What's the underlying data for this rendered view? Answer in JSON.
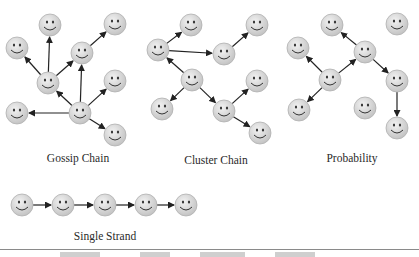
{
  "diagrams": [
    {
      "id": "gossip",
      "label": "Gossip Chain",
      "label_pos": [
        78,
        152
      ],
      "nodes": [
        [
          50,
          25
        ],
        [
          115,
          24
        ],
        [
          17,
          48
        ],
        [
          82,
          53
        ],
        [
          48,
          83
        ],
        [
          115,
          81
        ],
        [
          17,
          113
        ],
        [
          80,
          113
        ],
        [
          115,
          135
        ]
      ],
      "edges": [
        [
          7,
          4
        ],
        [
          7,
          3
        ],
        [
          7,
          6
        ],
        [
          7,
          5
        ],
        [
          7,
          8
        ],
        [
          4,
          2
        ],
        [
          4,
          0
        ],
        [
          4,
          3
        ],
        [
          3,
          1
        ]
      ]
    },
    {
      "id": "cluster",
      "label": "Cluster Chain",
      "label_pos": [
        216,
        154
      ],
      "nodes": [
        [
          158,
          50
        ],
        [
          191,
          25
        ],
        [
          224,
          54
        ],
        [
          257,
          25
        ],
        [
          192,
          80
        ],
        [
          162,
          109
        ],
        [
          224,
          111
        ],
        [
          257,
          81
        ],
        [
          260,
          133
        ]
      ],
      "edges": [
        [
          0,
          1
        ],
        [
          0,
          2
        ],
        [
          2,
          3
        ],
        [
          4,
          0
        ],
        [
          4,
          5
        ],
        [
          4,
          6
        ],
        [
          6,
          7
        ],
        [
          6,
          8
        ]
      ]
    },
    {
      "id": "probability",
      "label": "Probability",
      "label_pos": [
        352,
        152
      ],
      "nodes": [
        [
          332,
          25
        ],
        [
          397,
          24
        ],
        [
          298,
          48
        ],
        [
          365,
          52
        ],
        [
          330,
          80
        ],
        [
          397,
          81
        ],
        [
          299,
          110
        ],
        [
          365,
          108
        ],
        [
          397,
          128
        ]
      ],
      "edges": [
        [
          4,
          2
        ],
        [
          4,
          3
        ],
        [
          4,
          6
        ],
        [
          3,
          0
        ],
        [
          3,
          5
        ],
        [
          5,
          8
        ]
      ]
    },
    {
      "id": "single",
      "label": "Single Strand",
      "label_pos": [
        105,
        230
      ],
      "nodes": [
        [
          22,
          205
        ],
        [
          63,
          205
        ],
        [
          105,
          205
        ],
        [
          146,
          205
        ],
        [
          186,
          205
        ]
      ],
      "edges": [
        [
          0,
          1
        ],
        [
          1,
          2
        ],
        [
          2,
          3
        ],
        [
          3,
          4
        ]
      ]
    }
  ],
  "style": {
    "node_fill": "#d9d9d9",
    "node_stroke": "#b0b0b0",
    "face_color": "#333333",
    "arrow_color": "#222222",
    "node_radius": 11
  }
}
